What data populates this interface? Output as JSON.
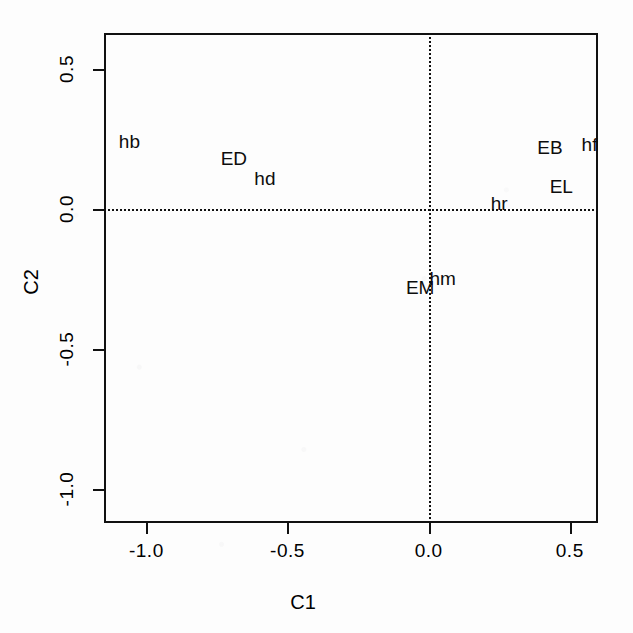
{
  "chart_data": {
    "type": "scatter",
    "title": "",
    "subtitle": "",
    "xlabel": "C1",
    "ylabel": "C2",
    "xlim": [
      -1.15,
      0.6
    ],
    "ylim": [
      -1.12,
      0.63
    ],
    "xticks": [
      "-1.0",
      "-0.5",
      "0.0",
      "0.5"
    ],
    "xtick_values": [
      -1.0,
      -0.5,
      0.0,
      0.5
    ],
    "yticks": [
      "0.5",
      "0.0",
      "-0.5",
      "-1.0"
    ],
    "ytick_values": [
      0.5,
      0.0,
      -0.5,
      -1.0
    ],
    "grid": false,
    "reference_lines": [
      {
        "name": "horizontal-zero-line",
        "orientation": "horizontal",
        "value": 0.0,
        "style": "dotted"
      },
      {
        "name": "vertical-zero-line",
        "orientation": "vertical",
        "value": 0.0,
        "style": "dotted"
      }
    ],
    "legend": null,
    "marker_style": "text-label-only",
    "points": [
      {
        "label": "hb",
        "x": -1.06,
        "y": 0.24
      },
      {
        "label": "ED",
        "x": -0.69,
        "y": 0.18
      },
      {
        "label": "hd",
        "x": -0.58,
        "y": 0.11
      },
      {
        "label": "EB",
        "x": 0.43,
        "y": 0.22
      },
      {
        "label": "hf",
        "x": 0.57,
        "y": 0.23
      },
      {
        "label": "EL",
        "x": 0.47,
        "y": 0.08
      },
      {
        "label": "hr",
        "x": 0.25,
        "y": 0.02
      },
      {
        "label": "EM",
        "x": -0.03,
        "y": -0.28
      },
      {
        "label": "hm",
        "x": 0.05,
        "y": -0.25
      }
    ]
  }
}
